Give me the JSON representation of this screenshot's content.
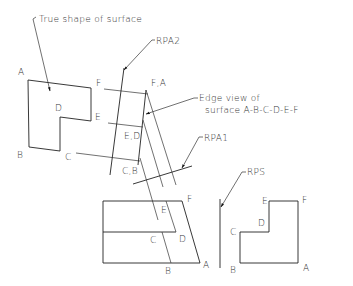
{
  "diagram": {
    "annotations": {
      "true_shape": "True shape of surface",
      "rpa2": "RPA2",
      "edge_view_line1": "Edge view of",
      "edge_view_line2": "surface A-B-C-D-E-F",
      "rpa1": "RPA1",
      "rps": "RPS"
    },
    "true_shape_labels": {
      "A": "A",
      "B": "B",
      "C": "C",
      "D": "D",
      "E": "E",
      "F": "F"
    },
    "edge_view_labels": {
      "FA": "F,A",
      "ED": "E,D",
      "CB": "C,B"
    },
    "front_view_labels": {
      "E": "E",
      "F": "F",
      "C": "C",
      "D": "D",
      "B": "B",
      "A": "A"
    },
    "side_view_labels": {
      "E": "E",
      "F": "F",
      "D": "D",
      "C": "C",
      "B": "B",
      "A": "A"
    },
    "colors": {
      "line": "#222222",
      "background": "#ffffff"
    }
  }
}
